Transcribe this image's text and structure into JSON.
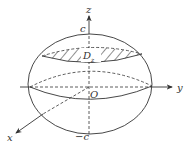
{
  "diagram": {
    "type": "ellipsoid-cross-section",
    "labels": {
      "z_axis": "z",
      "y_axis": "y",
      "x_axis": "x",
      "origin": "O",
      "top_intercept": "c",
      "bottom_intercept": "−c",
      "section": "D",
      "section_subscript": "z"
    },
    "colors": {
      "stroke": "#333333",
      "background": "#ffffff"
    }
  }
}
